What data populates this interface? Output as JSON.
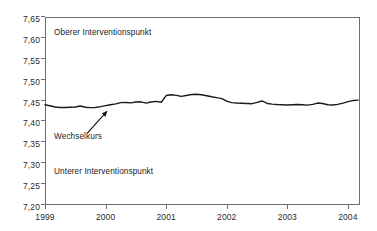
{
  "chart_data": {
    "type": "line",
    "title": "",
    "subtitle": "",
    "xlabel": "",
    "ylabel": "",
    "xlim": [
      1999.0,
      2004.2
    ],
    "ylim": [
      7.2,
      7.65
    ],
    "grid": false,
    "legend_position": "none",
    "x_ticks": [
      "1999",
      "2000",
      "2001",
      "2002",
      "2003",
      "2004"
    ],
    "x_tick_values": [
      1999,
      2000,
      2001,
      2002,
      2003,
      2004
    ],
    "y_ticks": [
      "7,20",
      "7,25",
      "7,30",
      "7,35",
      "7,40",
      "7,45",
      "7,50",
      "7,55",
      "7,60",
      "7,65"
    ],
    "y_tick_values": [
      7.2,
      7.25,
      7.3,
      7.35,
      7.4,
      7.45,
      7.5,
      7.55,
      7.6,
      7.65
    ],
    "y_tick_step": 0.05,
    "line_color": "#1a1a1a",
    "frame_color": "#6e6e6e",
    "annotations": [
      {
        "id": "oberer",
        "text": "Oberer Interventionspunkt",
        "x": 1999.15,
        "y": 7.612
      },
      {
        "id": "wechsel",
        "text": "Wechselkurs",
        "x": 1999.15,
        "y": 7.364
      },
      {
        "id": "unterer",
        "text": "Unterer Interventionspunkt",
        "x": 1999.15,
        "y": 7.278
      }
    ],
    "arrow": {
      "label": "wechselkurs-pointer",
      "from_x": 1999.7,
      "from_y": 7.372,
      "to_x": 2000.02,
      "to_y": 7.424
    },
    "series": [
      {
        "name": "Wechselkurs",
        "color": "#1a1a1a",
        "x": [
          1999.0,
          1999.08,
          1999.17,
          1999.25,
          1999.33,
          1999.42,
          1999.5,
          1999.58,
          1999.67,
          1999.75,
          1999.83,
          1999.92,
          2000.0,
          2000.08,
          2000.17,
          2000.25,
          2000.33,
          2000.42,
          2000.5,
          2000.58,
          2000.67,
          2000.75,
          2000.83,
          2000.92,
          2001.0,
          2001.08,
          2001.17,
          2001.25,
          2001.33,
          2001.42,
          2001.5,
          2001.58,
          2001.67,
          2001.75,
          2001.83,
          2001.92,
          2002.0,
          2002.08,
          2002.17,
          2002.25,
          2002.33,
          2002.42,
          2002.5,
          2002.58,
          2002.67,
          2002.75,
          2002.83,
          2002.92,
          2003.0,
          2003.08,
          2003.17,
          2003.25,
          2003.33,
          2003.42,
          2003.5,
          2003.58,
          2003.67,
          2003.75,
          2003.83,
          2003.92,
          2004.0,
          2004.08,
          2004.17
        ],
        "y": [
          7.44,
          7.4375,
          7.4345,
          7.4335,
          7.4335,
          7.434,
          7.4345,
          7.437,
          7.434,
          7.433,
          7.4335,
          7.4355,
          7.438,
          7.44,
          7.442,
          7.445,
          7.4455,
          7.4445,
          7.4465,
          7.447,
          7.444,
          7.4465,
          7.448,
          7.446,
          7.462,
          7.464,
          7.4625,
          7.46,
          7.462,
          7.4645,
          7.465,
          7.464,
          7.4615,
          7.459,
          7.457,
          7.4545,
          7.4485,
          7.445,
          7.444,
          7.4435,
          7.443,
          7.4425,
          7.4455,
          7.449,
          7.443,
          7.4415,
          7.4405,
          7.44,
          7.4395,
          7.44,
          7.4405,
          7.44,
          7.439,
          7.441,
          7.444,
          7.443,
          7.44,
          7.4395,
          7.441,
          7.444,
          7.4475,
          7.45,
          7.451
        ]
      }
    ]
  }
}
